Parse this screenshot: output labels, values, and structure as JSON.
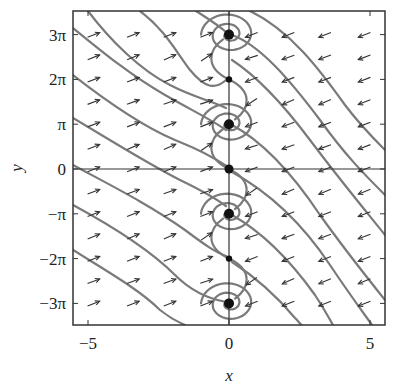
{
  "chart_data": {
    "type": "vector_field",
    "title": "",
    "xlabel": "x",
    "ylabel": "y",
    "xlim": [
      -5.5,
      5.5
    ],
    "ylim": [
      -10.4,
      10.7
    ],
    "xticks": [
      {
        "value": -5,
        "label": "−5"
      },
      {
        "value": 0,
        "label": "0"
      },
      {
        "value": 5,
        "label": "5"
      }
    ],
    "yticks": [
      {
        "value": 9.4248,
        "label": "3π"
      },
      {
        "value": 6.2832,
        "label": "2π"
      },
      {
        "value": 3.1416,
        "label": "π"
      },
      {
        "value": 0,
        "label": "0"
      },
      {
        "value": -3.1416,
        "label": "−π"
      },
      {
        "value": -6.2832,
        "label": "−2π"
      },
      {
        "value": -9.4248,
        "label": "−3π"
      }
    ],
    "reference_lines": {
      "x": 0,
      "y": 0
    },
    "equilibria": [
      {
        "x": 0,
        "y": 9.4248,
        "type": "stable spiral"
      },
      {
        "x": 0,
        "y": 6.2832,
        "type": "saddle"
      },
      {
        "x": 0,
        "y": 3.1416,
        "type": "stable spiral"
      },
      {
        "x": 0,
        "y": 0,
        "type": "saddle"
      },
      {
        "x": 0,
        "y": -3.1416,
        "type": "stable spiral"
      },
      {
        "x": 0,
        "y": -6.2832,
        "type": "saddle"
      },
      {
        "x": 0,
        "y": -9.4248,
        "type": "stable spiral"
      }
    ],
    "field_description": "Left half-plane arrows point down-right; right half-plane arrows point up-left; trajectories drift diagonally toward the y-axis and spiral into equilibria at odd multiples of π.",
    "grid": false,
    "legend": null
  },
  "labels": {
    "x": "x",
    "y": "y"
  }
}
